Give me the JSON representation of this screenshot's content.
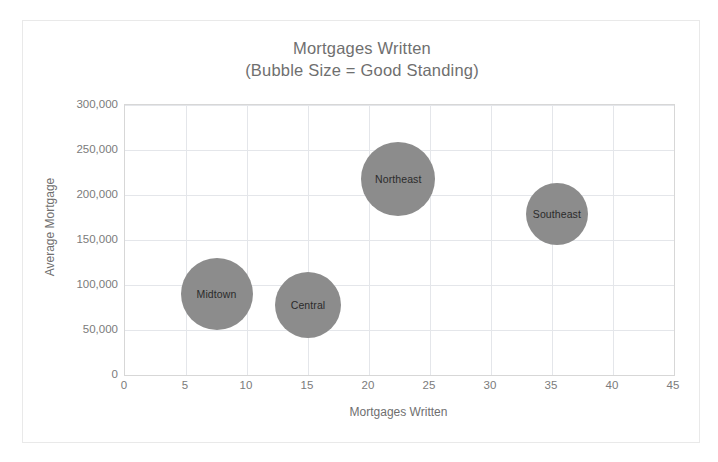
{
  "chart_data": {
    "type": "scatter",
    "title": "Mortgages Written",
    "subtitle": "(Bubble Size = Good Standing)",
    "xlabel": "Mortgages Written",
    "ylabel": "Average Mortgage",
    "xlim": [
      0,
      45
    ],
    "ylim": [
      0,
      300000
    ],
    "xticks": [
      "0",
      "5",
      "10",
      "15",
      "20",
      "25",
      "30",
      "35",
      "40",
      "45"
    ],
    "xtick_values": [
      0,
      5,
      10,
      15,
      20,
      25,
      30,
      35,
      40,
      45
    ],
    "yticks": [
      "0",
      "50,000",
      "100,000",
      "150,000",
      "200,000",
      "250,000",
      "300,000"
    ],
    "ytick_values": [
      0,
      50000,
      100000,
      150000,
      200000,
      250000,
      300000
    ],
    "grid": true,
    "legend": "none",
    "bubble_color": "#8c8c8c",
    "points": [
      {
        "label": "Midtown",
        "x": 7.5,
        "y": 90000,
        "size": 36
      },
      {
        "label": "Central",
        "x": 15.0,
        "y": 78000,
        "size": 33
      },
      {
        "label": "Northeast",
        "x": 22.4,
        "y": 218000,
        "size": 37
      },
      {
        "label": "Southeast",
        "x": 35.4,
        "y": 179000,
        "size": 31
      }
    ]
  }
}
